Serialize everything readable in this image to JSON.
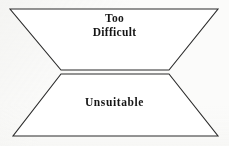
{
  "diagram": {
    "kind": "hourglass-funnel",
    "background_color": "#fbfbfa",
    "stroke_color": "#2b2b2b",
    "fill_color": "#ffffff",
    "stroke_width": 1.1,
    "upper_region": {
      "name": "too-difficult-region",
      "label_line_1": "Too",
      "label_line_2": "Difficult",
      "points": "10,9 218,9 169,70 61,70"
    },
    "lower_region": {
      "name": "unsuitable-region",
      "label": "Unsuitable",
      "points": "61,74 169,74 218,136 13,136"
    },
    "waist": {
      "name": "waist-divider",
      "left_x": 61,
      "right_x": 169,
      "upper_y": 70,
      "lower_y": 74
    }
  }
}
